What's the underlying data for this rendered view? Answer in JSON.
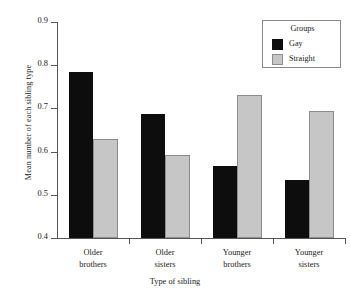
{
  "chart_data": {
    "type": "bar",
    "title": "",
    "xlabel": "Type of sibling",
    "ylabel": "Mean number of each sibling type",
    "categories": [
      "Older brothers",
      "Older sisters",
      "Younger brothers",
      "Younger sisters"
    ],
    "category_lines": [
      [
        "Older",
        "brothers"
      ],
      [
        "Older",
        "sisters"
      ],
      [
        "Younger",
        "brothers"
      ],
      [
        "Younger",
        "sisters"
      ]
    ],
    "series": [
      {
        "name": "Gay",
        "color": "#0d0d0d",
        "values": [
          0.785,
          0.688,
          0.566,
          0.534
        ]
      },
      {
        "name": "Straight",
        "color": "#c6c6c6",
        "values": [
          0.63,
          0.593,
          0.732,
          0.694
        ]
      }
    ],
    "ylim": [
      0.4,
      0.9
    ],
    "yticks": [
      0.4,
      0.5,
      0.6,
      0.7,
      0.8,
      0.9
    ],
    "ytick_labels": [
      "0.4",
      "0.5",
      "0.6",
      "0.7",
      "0.8",
      "0.9"
    ],
    "grid": false,
    "legend": {
      "title": "Groups",
      "position": "top-right",
      "entries": [
        {
          "label": "Gay",
          "color": "#0d0d0d"
        },
        {
          "label": "Straight",
          "color": "#c6c6c6"
        }
      ]
    }
  }
}
